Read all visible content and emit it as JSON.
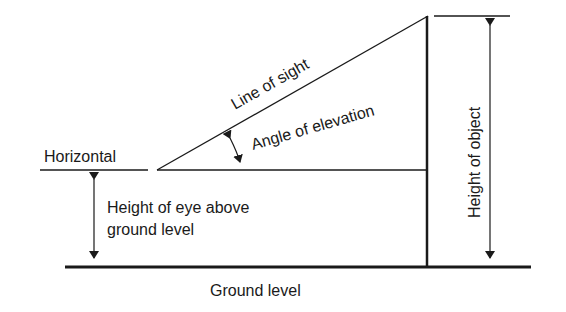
{
  "diagram": {
    "title": "Angle of elevation",
    "labels": {
      "horizontal": "Horizontal",
      "line_of_sight": "Line of sight",
      "angle_of_elevation": "Angle of elevation",
      "height_of_object": "Height of object",
      "eye_height_line1": "Height of eye above",
      "eye_height_line2": "ground level",
      "ground_level": "Ground level"
    },
    "colors": {
      "ink": "#1a1a1a",
      "background": "#ffffff"
    }
  }
}
